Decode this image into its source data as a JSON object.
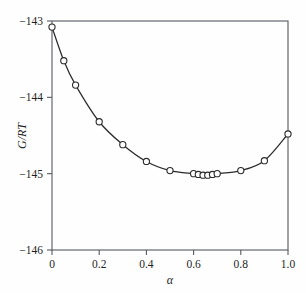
{
  "chart_data": {
    "type": "line",
    "title": "",
    "subtitle": "",
    "xlabel": "α",
    "ylabel": "G/RT",
    "xlim": [
      0.0,
      1.0
    ],
    "ylim": [
      -146.0,
      -143.0
    ],
    "grid": false,
    "legend": null,
    "xticks": [
      0.0,
      0.2,
      0.4,
      0.6,
      0.8,
      1.0
    ],
    "xtick_labels": [
      "0",
      "0.2",
      "0.4",
      "0.6",
      "0.8",
      "1.0"
    ],
    "yticks": [
      -143,
      -144,
      -145,
      -146
    ],
    "ytick_labels": [
      "−143",
      "−144",
      "−145",
      "−146"
    ],
    "marker": "open-circle",
    "series": [
      {
        "name": "G/RT vs alpha",
        "x": [
          0.0,
          0.05,
          0.1,
          0.2,
          0.3,
          0.4,
          0.5,
          0.6,
          0.62,
          0.64,
          0.66,
          0.68,
          0.7,
          0.8,
          0.9,
          1.0
        ],
        "y": [
          -143.08,
          -143.52,
          -143.84,
          -144.32,
          -144.62,
          -144.84,
          -144.96,
          -145.0,
          -145.01,
          -145.02,
          -145.02,
          -145.01,
          -145.0,
          -144.96,
          -144.83,
          -144.48
        ]
      }
    ],
    "annotations": []
  },
  "axes": {
    "frame_color": "#555a5e",
    "curve_color": "#2b2b2b",
    "marker_face_color": "#ffffff",
    "background_color": "#fefefe"
  }
}
